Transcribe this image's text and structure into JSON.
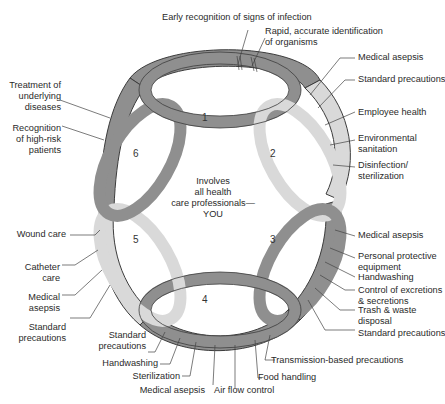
{
  "colors": {
    "dark_loop": "#8f8f8f",
    "light_loop": "#d9d9d9",
    "outline": "#3c3c3c",
    "text": "#2a2a2a",
    "leader": "#444444"
  },
  "center_text": [
    "Involves",
    "all health",
    "care professionals—",
    "YOU"
  ],
  "loops": [
    {
      "number": "1"
    },
    {
      "number": "2"
    },
    {
      "number": "3"
    },
    {
      "number": "4"
    },
    {
      "number": "5"
    },
    {
      "number": "6"
    }
  ],
  "labels": {
    "top": [
      "Early recognition of signs of infection",
      "Rapid, accurate identification",
      "of organisms"
    ],
    "right_upper": [
      "Medical asepsis",
      "Standard precautions",
      "Employee health",
      "Environmental",
      "sanitation",
      "Disinfection/",
      "sterilization"
    ],
    "right_lower": [
      "Medical asepsis",
      "Personal protective",
      "equipment",
      "Handwashing",
      "Control of excretions",
      "& secretions",
      "Trash & waste",
      "disposal",
      "Standard precautions"
    ],
    "bottom": [
      "Transmission-based precautions",
      "Food handling",
      "Air flow control",
      "Medical asepsis",
      "Sterilization",
      "Handwashing",
      "Standard",
      "precautions"
    ],
    "left_lower": [
      "Wound care",
      "Catheter",
      "care",
      "Medical",
      "asepsis",
      "Standard",
      "precautions"
    ],
    "left_upper": [
      "Treatment of",
      "underlying",
      "diseases",
      "Recognition",
      "of high-risk",
      "patients"
    ]
  }
}
